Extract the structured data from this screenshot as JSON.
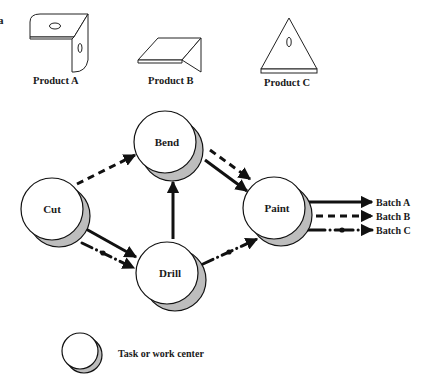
{
  "clipped_fragment": "a",
  "products": [
    {
      "label": "Product A",
      "icon": "l-bracket-part"
    },
    {
      "label": "Product B",
      "icon": "angled-plate-part"
    },
    {
      "label": "Product C",
      "icon": "triangle-plate-part"
    }
  ],
  "nodes": {
    "cut": {
      "label": "Cut"
    },
    "bend": {
      "label": "Bend"
    },
    "drill": {
      "label": "Drill"
    },
    "paint": {
      "label": "Paint"
    }
  },
  "outputs": [
    {
      "label": "Batch A",
      "style": "solid"
    },
    {
      "label": "Batch B",
      "style": "dashed"
    },
    {
      "label": "Batch C",
      "style": "dash-dot"
    }
  ],
  "flows": [
    {
      "from": "Cut",
      "to": "Bend",
      "style": "dashed"
    },
    {
      "from": "Cut",
      "to": "Drill",
      "style": "solid"
    },
    {
      "from": "Cut",
      "to": "Drill",
      "style": "dash-dot"
    },
    {
      "from": "Drill",
      "to": "Bend",
      "style": "solid"
    },
    {
      "from": "Bend",
      "to": "Paint",
      "style": "solid"
    },
    {
      "from": "Bend",
      "to": "Paint",
      "style": "dashed"
    },
    {
      "from": "Drill",
      "to": "Paint",
      "style": "dash-dot"
    }
  ],
  "legend": {
    "label": "Task or work center"
  },
  "colors": {
    "line": "#111111",
    "shadow": "#bdbdbd",
    "node_fill": "#ffffff"
  }
}
